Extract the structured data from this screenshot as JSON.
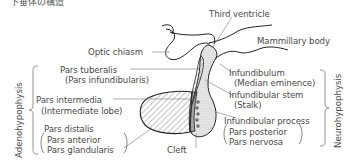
{
  "title": "下垂体の構造",
  "labels": {
    "third_ventricle": "Third ventricle",
    "optic_chiasm": "Optic chiasm",
    "mammillary_body": "Mammillary body",
    "pars_tuberalis": "Pars tuberalis",
    "pars_tuberalis_alt": "(Pars infundibularis)",
    "infundibulum": "Infundibulum",
    "infundibulum_alt": "(Median eminence)",
    "infundibular_stem": "Infundibular stem",
    "infundibular_stem_alt": "(Stalk)",
    "pars_intermedia": "Pars intermedia",
    "pars_intermedia_alt": "(Intermediate lobe)",
    "pars_distalis": "Pars distalis",
    "pars_distalis_alt1": "Pars anterior",
    "pars_distalis_alt2": "Pars glandularis",
    "cleft": "Cleft",
    "infundibular_process": "Infundibular process",
    "infundibular_process_alt1": "Pars posterior",
    "infundibular_process_alt2": "Pars nervosa"
  },
  "groups": {
    "adenohypophysis": "Adenohypophysis",
    "neurohypophysis": "Neurohypophysis"
  }
}
